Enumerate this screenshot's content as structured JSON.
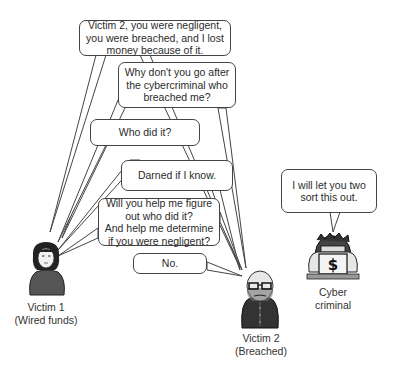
{
  "diagram": {
    "speech_bubbles": [
      {
        "id": "b1",
        "speaker": "Victim 1",
        "text": "Victim 2, you were negligent,\nyou were breached, and I lost\nmoney because of it."
      },
      {
        "id": "b2",
        "speaker": "Victim 1",
        "text": "Why don't you go after\nthe cybercriminal who\nbreached me?"
      },
      {
        "id": "b3",
        "speaker": "Victim 1",
        "text": "Who did it?"
      },
      {
        "id": "b4",
        "speaker": "Victim 2",
        "text": "Darned if I know."
      },
      {
        "id": "b5",
        "speaker": "Victim 1",
        "text": "Will you help me figure\nout who did it?\nAnd help me determine\nif you were negligent?"
      },
      {
        "id": "b6",
        "speaker": "Victim 2",
        "text": "No."
      },
      {
        "id": "b7",
        "speaker": "Cyber criminal",
        "text": "I will let you two\nsort this out."
      }
    ],
    "characters": [
      {
        "id": "victim1",
        "label": "Victim 1\n(Wired funds)",
        "icon": "woman-icon"
      },
      {
        "id": "victim2",
        "label": "Victim 2\n(Breached)",
        "icon": "bald-man-icon"
      },
      {
        "id": "criminal",
        "label": "Cyber\ncriminal",
        "icon": "cybercriminal-laptop-icon",
        "laptop_symbol": "$"
      }
    ],
    "colors": {
      "line": "#444444",
      "figure_dark": "#3a3a3a",
      "figure_mid": "#6b6b6b",
      "background": "#ffffff"
    }
  }
}
